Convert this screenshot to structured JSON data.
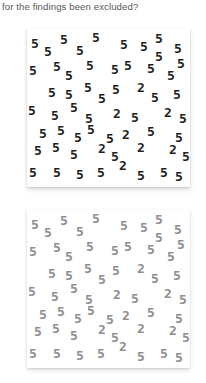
{
  "question": {
    "text": "for the findings been excluded?"
  },
  "colors": {
    "page_background": "#ffffff",
    "question_text": "#58585a",
    "panel_background": "#ffffff",
    "high_contrast_glyph": "#231f20",
    "low_contrast_glyph": "#8e8e90"
  },
  "stimulus": {
    "target_digit": "2",
    "distractor_digit": "5",
    "glyph_count": 58,
    "target_count": 8,
    "distractor_count": 50
  },
  "panels": [
    {
      "name": "high-contrast-panel",
      "label": "high contrast",
      "glyph_color": "#231f20"
    },
    {
      "name": "low-contrast-panel",
      "label": "low contrast",
      "glyph_color": "#8e8e90"
    }
  ],
  "glyphs": [
    {
      "char": "5",
      "x": 4,
      "y": 9
    },
    {
      "char": "5",
      "x": 17,
      "y": 17
    },
    {
      "char": "5",
      "x": 33,
      "y": 5
    },
    {
      "char": "5",
      "x": 49,
      "y": 16
    },
    {
      "char": "5",
      "x": 65,
      "y": 3
    },
    {
      "char": "5",
      "x": 93,
      "y": 10
    },
    {
      "char": "5",
      "x": 113,
      "y": 12
    },
    {
      "char": "5",
      "x": 128,
      "y": 4
    },
    {
      "char": "5",
      "x": 128,
      "y": 22
    },
    {
      "char": "5",
      "x": 147,
      "y": 14
    },
    {
      "char": "5",
      "x": 2,
      "y": 36
    },
    {
      "char": "5",
      "x": 26,
      "y": 32
    },
    {
      "char": "5",
      "x": 38,
      "y": 41
    },
    {
      "char": "5",
      "x": 59,
      "y": 31
    },
    {
      "char": "5",
      "x": 84,
      "y": 35
    },
    {
      "char": "5",
      "x": 97,
      "y": 31
    },
    {
      "char": "5",
      "x": 120,
      "y": 34
    },
    {
      "char": "5",
      "x": 140,
      "y": 41
    },
    {
      "char": "5",
      "x": 150,
      "y": 29
    },
    {
      "char": "5",
      "x": 21,
      "y": 58
    },
    {
      "char": "5",
      "x": 38,
      "y": 60
    },
    {
      "char": "5",
      "x": 57,
      "y": 53
    },
    {
      "char": "5",
      "x": 71,
      "y": 64
    },
    {
      "char": "5",
      "x": 85,
      "y": 55
    },
    {
      "char": "2",
      "x": 110,
      "y": 53
    },
    {
      "char": "5",
      "x": 124,
      "y": 63
    },
    {
      "char": "5",
      "x": 146,
      "y": 60
    },
    {
      "char": "5",
      "x": 1,
      "y": 76
    },
    {
      "char": "5",
      "x": 24,
      "y": 81
    },
    {
      "char": "5",
      "x": 43,
      "y": 73
    },
    {
      "char": "5",
      "x": 58,
      "y": 84
    },
    {
      "char": "2",
      "x": 86,
      "y": 79
    },
    {
      "char": "5",
      "x": 104,
      "y": 83
    },
    {
      "char": "2",
      "x": 137,
      "y": 78
    },
    {
      "char": "5",
      "x": 152,
      "y": 84
    },
    {
      "char": "5",
      "x": 12,
      "y": 99
    },
    {
      "char": "5",
      "x": 30,
      "y": 96
    },
    {
      "char": "5",
      "x": 47,
      "y": 103
    },
    {
      "char": "5",
      "x": 60,
      "y": 95
    },
    {
      "char": "5",
      "x": 79,
      "y": 104
    },
    {
      "char": "2",
      "x": 95,
      "y": 100
    },
    {
      "char": "5",
      "x": 120,
      "y": 97
    },
    {
      "char": "5",
      "x": 148,
      "y": 103
    },
    {
      "char": "5",
      "x": 7,
      "y": 116
    },
    {
      "char": "5",
      "x": 25,
      "y": 113
    },
    {
      "char": "5",
      "x": 43,
      "y": 120
    },
    {
      "char": "2",
      "x": 71,
      "y": 114
    },
    {
      "char": "5",
      "x": 84,
      "y": 122
    },
    {
      "char": "2",
      "x": 110,
      "y": 113
    },
    {
      "char": "2",
      "x": 142,
      "y": 115
    },
    {
      "char": "5",
      "x": 155,
      "y": 122
    },
    {
      "char": "5",
      "x": 2,
      "y": 138
    },
    {
      "char": "5",
      "x": 26,
      "y": 138
    },
    {
      "char": "5",
      "x": 49,
      "y": 140
    },
    {
      "char": "5",
      "x": 70,
      "y": 138
    },
    {
      "char": "2",
      "x": 92,
      "y": 131
    },
    {
      "char": "5",
      "x": 110,
      "y": 141
    },
    {
      "char": "5",
      "x": 133,
      "y": 138
    },
    {
      "char": "5",
      "x": 148,
      "y": 142
    }
  ]
}
